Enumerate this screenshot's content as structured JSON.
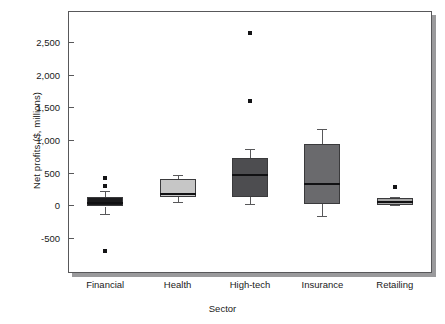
{
  "chart_data": {
    "type": "box",
    "title": "",
    "xlabel": "Sector",
    "ylabel": "Net profits ($, millions)",
    "ylim": [
      -900,
      2800
    ],
    "ytick_values": [
      2500,
      2000,
      1500,
      1000,
      500,
      0,
      -500
    ],
    "ytick_labels": [
      "2,500",
      "2,000",
      "1,500",
      "1,000",
      "500",
      "0",
      "-500"
    ],
    "grid": false,
    "legend": "none",
    "categories": [
      "Financial",
      "Health",
      "High-tech",
      "Insurance",
      "Retailing"
    ],
    "boxes": [
      {
        "category": "Financial",
        "whisker_low": -130,
        "q1": -20,
        "median": 40,
        "q3": 130,
        "whisker_high": 215,
        "outliers": [
          410,
          300,
          -700
        ],
        "fill": "#1b1b1d"
      },
      {
        "category": "Health",
        "whisker_low": 55,
        "q1": 130,
        "median": 175,
        "q3": 400,
        "whisker_high": 465,
        "outliers": [],
        "fill": "#c6c6c6"
      },
      {
        "category": "High-tech",
        "whisker_low": 25,
        "q1": 130,
        "median": 470,
        "q3": 725,
        "whisker_high": 855,
        "outliers": [
          2645,
          1590
        ],
        "fill": "#4d4d50"
      },
      {
        "category": "Insurance",
        "whisker_low": -160,
        "q1": 20,
        "median": 320,
        "q3": 945,
        "whisker_high": 1160,
        "outliers": [],
        "fill": "#6a6a6d"
      },
      {
        "category": "Retailing",
        "whisker_low": 0,
        "q1": 10,
        "median": 55,
        "q3": 110,
        "whisker_high": 120,
        "outliers": [
          275
        ],
        "fill": "#a6a6a6"
      }
    ]
  },
  "axis": {
    "y_title": "Net profits ($, millions)",
    "x_title": "Sector"
  },
  "colors": {
    "frame": "#58585a",
    "shadow": "#9a9a9c",
    "outlier": "#141416",
    "median": "#111113",
    "background": "#ffffff"
  }
}
